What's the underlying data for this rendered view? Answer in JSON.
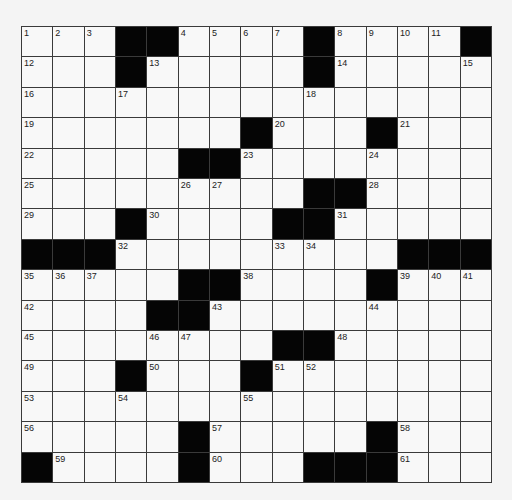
{
  "puzzle": {
    "type": "crossword",
    "rows": 15,
    "cols": 15,
    "colors": {
      "block": "#050505",
      "cell": "#f8f8f8",
      "line": "#3a3a3a",
      "background": "#f4f4f4"
    },
    "grid": [
      [
        "1",
        "2",
        "3",
        "#",
        "#",
        "4",
        "5",
        "6",
        "7",
        "#",
        "8",
        "9",
        "10",
        "11",
        "#"
      ],
      [
        "12",
        "",
        "",
        "#",
        "13",
        "",
        "",
        "",
        "",
        "#",
        "14",
        "",
        "",
        "",
        "15"
      ],
      [
        "16",
        "",
        "",
        "17",
        "",
        "",
        "",
        "",
        "",
        "18",
        "",
        "",
        "",
        "",
        ""
      ],
      [
        "19",
        "",
        "",
        "",
        "",
        "",
        "",
        "#",
        "20",
        "",
        "",
        "#",
        "21",
        "",
        ""
      ],
      [
        "22",
        "",
        "",
        "",
        "",
        "#",
        "#",
        "23",
        "",
        "",
        "",
        "24",
        "",
        "",
        ""
      ],
      [
        "25",
        "",
        "",
        "",
        "",
        "26",
        "27",
        "",
        "",
        "#",
        "#",
        "28",
        "",
        "",
        ""
      ],
      [
        "29",
        "",
        "",
        "#",
        "30",
        "",
        "",
        "",
        "#",
        "#",
        "31",
        "",
        "",
        "",
        ""
      ],
      [
        "#",
        "#",
        "#",
        "32",
        "",
        "",
        "",
        "",
        "33",
        "34",
        "",
        "",
        "#",
        "#",
        "#"
      ],
      [
        "35",
        "36",
        "37",
        "",
        "",
        "#",
        "#",
        "38",
        "",
        "",
        "",
        "#",
        "39",
        "40",
        "41"
      ],
      [
        "42",
        "",
        "",
        "",
        "#",
        "#",
        "43",
        "",
        "",
        "",
        "",
        "44",
        "",
        "",
        ""
      ],
      [
        "45",
        "",
        "",
        "",
        "46",
        "47",
        "",
        "",
        "#",
        "#",
        "48",
        "",
        "",
        "",
        ""
      ],
      [
        "49",
        "",
        "",
        "#",
        "50",
        "",
        "",
        "#",
        "51",
        "52",
        "",
        "",
        "",
        "",
        ""
      ],
      [
        "53",
        "",
        "",
        "54",
        "",
        "",
        "",
        "55",
        "",
        "",
        "",
        "",
        "",
        "",
        ""
      ],
      [
        "56",
        "",
        "",
        "",
        "",
        "#",
        "57",
        "",
        "",
        "",
        "",
        "#",
        "58",
        "",
        ""
      ],
      [
        "#",
        "59",
        "",
        "",
        "",
        "#",
        "60",
        "",
        "",
        "#",
        "#",
        "#",
        "61",
        "",
        ""
      ]
    ]
  }
}
